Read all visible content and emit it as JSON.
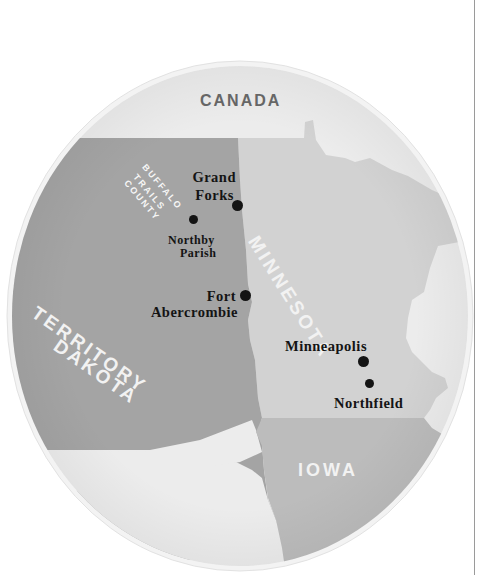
{
  "map": {
    "colors": {
      "outside": "#ececec",
      "dakota": "#a4a4a4",
      "minnesota": "#d2d2d2",
      "iowa": "#bcbcbc",
      "rim": "#f4f4f4",
      "label_dark": "#666666",
      "label_light": "#f2f2f2",
      "city_text": "#141414"
    },
    "regions": {
      "canada": "CANADA",
      "minnesota": "MINNESOTA",
      "dakota_line1": "DAKOTA",
      "dakota_line2": "TERRITORY",
      "iowa": "IOWA",
      "county_line1": "BUFFALO",
      "county_line2": "TRAILS",
      "county_line3": "COUNTY"
    },
    "cities": [
      {
        "name_line1": "Grand",
        "name_line2": "Forks"
      },
      {
        "name_line1": "Northby",
        "name_line2": "Parish"
      },
      {
        "name_line1": "Fort",
        "name_line2": "Abercrombie"
      },
      {
        "name_line1": "Minneapolis"
      },
      {
        "name_line1": "Northfield"
      }
    ]
  }
}
